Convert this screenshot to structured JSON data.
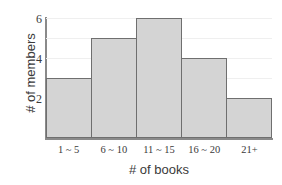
{
  "chart_data": {
    "type": "bar",
    "title": "",
    "xlabel": "# of books",
    "ylabel": "# of members",
    "categories": [
      "1 ~ 5",
      "6 ~ 10",
      "11 ~ 15",
      "16 ~ 20",
      "21+"
    ],
    "values": [
      3,
      5,
      6,
      4,
      2
    ],
    "ylim": [
      0,
      6
    ],
    "yticks": [
      2,
      4,
      6
    ],
    "ytick_labels": [
      "2",
      "4",
      "6"
    ],
    "grid": true,
    "legend": null,
    "bar_fill_color": "#d4d4d4",
    "bar_border_color": "#6f6f6f",
    "axis_color": "#8a8a8a",
    "gridline_color": "#efefef",
    "text_color": "#3a3a3a"
  }
}
